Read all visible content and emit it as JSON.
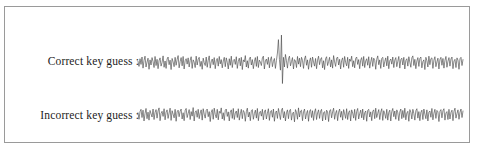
{
  "figure": {
    "background_color": "#ffffff",
    "frame_color": "#9a9a9a",
    "trace_color": "#4a4a4a"
  },
  "rows": [
    {
      "key": "correct",
      "label": "Correct key guess  :",
      "icon": "waveform-icon"
    },
    {
      "key": "incorrect",
      "label": "Incorrect key guess :",
      "icon": "waveform-icon"
    }
  ],
  "chart_data": {
    "type": "line",
    "title": "",
    "subtitle": "",
    "xlabel": "",
    "ylabel": "",
    "grid": false,
    "legend": false,
    "axis_visible": false,
    "xlim": [
      0,
      325
    ],
    "ylim": [
      -1,
      1
    ],
    "series": [
      {
        "name": "Correct key guess",
        "peak_present": true,
        "peak_x": 141,
        "peak_positive_y": 0.98,
        "peak_negative_y": -0.72,
        "noise_amplitude": 0.19,
        "baseline": 0.0,
        "values": [
          0.06,
          -0.12,
          0.15,
          -0.05,
          0.21,
          -0.18,
          0.09,
          0.24,
          -0.14,
          0.03,
          0.17,
          -0.22,
          0.11,
          -0.07,
          0.19,
          0.05,
          -0.16,
          0.23,
          -0.09,
          0.13,
          -0.2,
          0.08,
          0.18,
          -0.11,
          0.02,
          0.25,
          -0.15,
          0.07,
          -0.19,
          0.14,
          0.21,
          -0.06,
          0.1,
          -0.23,
          0.16,
          0.04,
          -0.13,
          0.2,
          -0.08,
          0.12,
          0.26,
          -0.17,
          0.05,
          0.19,
          -0.1,
          0.23,
          -0.21,
          0.08,
          0.15,
          -0.04,
          0.18,
          -0.14,
          0.09,
          0.22,
          -0.19,
          0.11,
          0.03,
          -0.16,
          0.24,
          -0.07,
          0.13,
          0.2,
          -0.12,
          0.06,
          -0.22,
          0.17,
          0.01,
          -0.09,
          0.21,
          -0.15,
          0.1,
          0.25,
          -0.18,
          0.04,
          0.14,
          -0.06,
          0.19,
          -0.2,
          0.08,
          0.16,
          -0.11,
          0.23,
          -0.03,
          0.12,
          -0.17,
          0.07,
          0.2,
          -0.13,
          0.18,
          0.02,
          -0.21,
          0.15,
          -0.08,
          0.24,
          -0.16,
          0.09,
          0.13,
          -0.05,
          0.22,
          -0.19,
          0.06,
          0.17,
          -0.1,
          0.2,
          -0.23,
          0.11,
          0.04,
          0.26,
          -0.14,
          0.08,
          -0.18,
          0.15,
          0.21,
          -0.07,
          0.12,
          -0.2,
          0.05,
          0.19,
          -0.12,
          0.23,
          -0.16,
          0.1,
          0.03,
          -0.09,
          0.18,
          0.24,
          -0.21,
          0.07,
          0.14,
          -0.05,
          0.2,
          -0.17,
          0.11,
          0.22,
          -0.13,
          0.06,
          0.16,
          -0.19,
          0.09,
          0.35,
          0.82,
          0.12,
          -0.25,
          0.98,
          -0.72,
          0.2,
          -0.14,
          0.3,
          0.08,
          -0.18,
          0.15,
          0.24,
          -0.1,
          0.05,
          0.19,
          -0.21,
          0.12,
          0.07,
          -0.16,
          0.23,
          -0.04,
          0.17,
          -0.13,
          0.2,
          0.09,
          -0.19,
          0.14,
          0.25,
          -0.08,
          0.11,
          -0.22,
          0.06,
          0.18,
          -0.15,
          0.21,
          0.03,
          -0.11,
          0.16,
          -0.2,
          0.1,
          0.24,
          -0.06,
          0.13,
          0.19,
          -0.17,
          0.08,
          -0.23,
          0.15,
          0.22,
          -0.09,
          0.05,
          0.2,
          -0.14,
          0.11,
          -0.18,
          0.26,
          0.04,
          -0.12,
          0.17,
          0.21,
          -0.07,
          0.13,
          -0.21,
          0.09,
          0.18,
          -0.15,
          0.23,
          0.02,
          -0.1,
          0.2,
          -0.19,
          0.14,
          0.06,
          0.24,
          -0.13,
          0.08,
          -0.17,
          0.16,
          0.21,
          -0.05,
          0.12,
          -0.2,
          0.1,
          0.19,
          -0.11,
          0.23,
          -0.16,
          0.07,
          0.15,
          -0.08,
          0.22,
          -0.18,
          0.04,
          0.2,
          -0.12,
          0.17,
          0.09,
          -0.22,
          0.13,
          0.25,
          -0.06,
          0.11,
          -0.19,
          0.16,
          0.2,
          -0.14,
          0.05,
          0.18,
          -0.1,
          0.24,
          -0.2,
          0.08,
          0.14,
          -0.04,
          0.21,
          -0.16,
          0.1,
          0.19,
          -0.13,
          0.06,
          0.23,
          -0.18,
          0.12,
          0.17,
          -0.07,
          0.2,
          -0.21,
          0.09,
          0.15,
          -0.11,
          0.22,
          0.03,
          -0.15,
          0.18,
          0.25,
          -0.09,
          0.13,
          -0.2,
          0.07,
          0.19,
          -0.12,
          0.16,
          0.21,
          -0.17,
          0.05,
          0.11,
          -0.23,
          0.2,
          0.08,
          -0.14,
          0.24,
          -0.06,
          0.15,
          0.18,
          -0.19,
          0.1,
          0.22,
          -0.13,
          0.04,
          0.17,
          -0.21,
          0.12,
          0.2,
          -0.08,
          0.16,
          -0.18,
          0.09,
          0.23,
          -0.15,
          0.06,
          0.19,
          -0.11,
          0.14,
          0.21,
          -0.2,
          0.07,
          0.13,
          -0.16,
          0.18,
          0.1,
          -0.22,
          0.15,
          0.2,
          -0.09,
          0.12
        ]
      },
      {
        "name": "Incorrect key guess",
        "peak_present": false,
        "noise_amplitude": 0.2,
        "baseline": 0.0,
        "values": [
          0.08,
          -0.15,
          0.12,
          0.2,
          -0.09,
          0.17,
          -0.21,
          0.05,
          0.23,
          -0.13,
          0.1,
          -0.18,
          0.16,
          0.04,
          -0.07,
          0.21,
          -0.16,
          0.09,
          0.19,
          -0.11,
          0.14,
          0.25,
          -0.2,
          0.06,
          0.13,
          -0.05,
          0.22,
          -0.17,
          0.1,
          0.18,
          -0.12,
          0.07,
          0.24,
          -0.19,
          0.15,
          0.03,
          -0.1,
          0.2,
          -0.22,
          0.11,
          0.17,
          -0.06,
          0.13,
          0.21,
          -0.14,
          0.08,
          -0.2,
          0.16,
          0.23,
          -0.09,
          0.05,
          0.19,
          -0.16,
          0.12,
          -0.04,
          0.26,
          -0.21,
          0.1,
          0.15,
          -0.08,
          0.2,
          -0.13,
          0.07,
          0.18,
          -0.18,
          0.22,
          0.03,
          -0.11,
          0.16,
          0.21,
          -0.06,
          0.12,
          -0.23,
          0.09,
          0.19,
          -0.15,
          0.24,
          0.02,
          -0.1,
          0.2,
          -0.17,
          0.13,
          0.06,
          0.25,
          -0.14,
          0.08,
          -0.19,
          0.17,
          0.21,
          -0.05,
          0.11,
          -0.21,
          0.1,
          0.18,
          -0.12,
          0.23,
          -0.16,
          0.07,
          0.14,
          -0.09,
          0.22,
          -0.18,
          0.04,
          0.2,
          -0.13,
          0.16,
          0.09,
          -0.22,
          0.12,
          0.24,
          -0.07,
          0.1,
          -0.2,
          0.15,
          0.19,
          -0.15,
          0.05,
          0.17,
          -0.11,
          0.23,
          -0.2,
          0.08,
          0.13,
          -0.04,
          0.2,
          -0.17,
          0.11,
          0.18,
          -0.14,
          0.06,
          0.22,
          -0.19,
          0.12,
          0.16,
          -0.08,
          0.21,
          -0.22,
          0.09,
          0.14,
          -0.12,
          0.23,
          0.03,
          -0.16,
          0.17,
          0.24,
          -0.1,
          0.12,
          -0.21,
          0.08,
          0.18,
          -0.13,
          0.15,
          0.2,
          -0.18,
          0.06,
          0.1,
          -0.24,
          0.19,
          0.09,
          -0.15,
          0.25,
          -0.07,
          0.14,
          0.17,
          -0.2,
          0.11,
          0.21,
          -0.14,
          0.05,
          0.16,
          -0.22,
          0.13,
          0.19,
          -0.09,
          0.15,
          -0.19,
          0.1,
          0.22,
          -0.16,
          0.07,
          0.18,
          -0.12,
          0.13,
          0.2,
          -0.21,
          0.08,
          0.12,
          -0.17,
          0.17,
          0.11,
          -0.23,
          0.14,
          0.19,
          -0.1,
          0.11,
          0.24,
          -0.15,
          0.06,
          0.16,
          -0.2,
          0.1,
          0.21,
          -0.08,
          0.13,
          -0.18,
          0.19,
          0.04,
          -0.12,
          0.22,
          -0.16,
          0.09,
          0.15,
          -0.21,
          0.18,
          0.07,
          -0.11,
          0.2,
          -0.19,
          0.12,
          0.23,
          -0.14,
          0.05,
          0.17,
          -0.1,
          0.21,
          -0.17,
          0.08,
          0.14,
          -0.22,
          0.16,
          0.2,
          -0.07,
          0.11,
          -0.2,
          0.13,
          0.18,
          -0.13,
          0.24,
          -0.09,
          0.06,
          0.19,
          -0.16,
          0.1,
          0.22,
          -0.19,
          0.15,
          0.04,
          -0.12,
          0.2,
          -0.18,
          0.09,
          0.17,
          -0.21,
          0.12,
          0.23,
          -0.06,
          0.14,
          -0.15,
          0.18,
          0.08,
          -0.2,
          0.11,
          0.21,
          -0.13,
          0.16,
          -0.09,
          0.24,
          -0.17,
          0.07,
          0.13,
          -0.22,
          0.19,
          0.1,
          -0.14,
          0.2,
          0.05,
          -0.18,
          0.15,
          0.22,
          -0.11,
          0.12,
          -0.2,
          0.09,
          0.17,
          -0.16,
          0.21,
          0.03,
          -0.13,
          0.18,
          -0.21,
          0.1,
          0.14,
          -0.08,
          0.23,
          -0.17,
          0.06,
          0.2,
          -0.12,
          0.16,
          0.11,
          -0.23,
          0.13,
          0.19,
          -0.1,
          0.15,
          0.22,
          -0.18,
          0.07,
          0.12,
          -0.16,
          0.2,
          -0.14,
          0.09,
          0.17,
          -0.2,
          0.13,
          0.24,
          -0.11,
          0.05,
          0.18,
          -0.15,
          0.1,
          0.21,
          -0.09,
          0.14
        ]
      }
    ]
  }
}
